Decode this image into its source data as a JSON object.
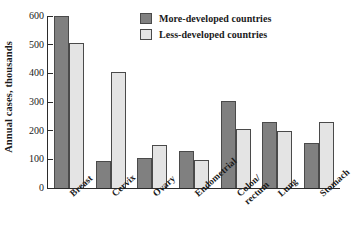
{
  "chart_data": {
    "type": "bar",
    "title": "",
    "xlabel": "",
    "ylabel": "Annual cases, thousands",
    "ylim": [
      0,
      600
    ],
    "yticks": [
      0,
      100,
      200,
      300,
      400,
      500,
      600
    ],
    "ytick_labels": [
      "0",
      "100",
      "200",
      "300",
      "400",
      "500",
      "600"
    ],
    "grid": false,
    "legend_position": "top-center",
    "categories": [
      "Breast",
      "Cervix",
      "Ovary",
      "Endometrial",
      "Colon/\nrectum",
      "Lung",
      "Stomach"
    ],
    "series": [
      {
        "name": "More-developed countries",
        "color": "#808080",
        "values": [
          600,
          95,
          105,
          130,
          305,
          230,
          158
        ]
      },
      {
        "name": "Less-developed countries",
        "color": "#e4e4e4",
        "values": [
          505,
          403,
          150,
          98,
          205,
          200,
          232
        ]
      }
    ]
  },
  "legend": {
    "items": [
      {
        "label": "More-developed countries",
        "swatch": "more"
      },
      {
        "label": "Less-developed countries",
        "swatch": "less"
      }
    ]
  }
}
